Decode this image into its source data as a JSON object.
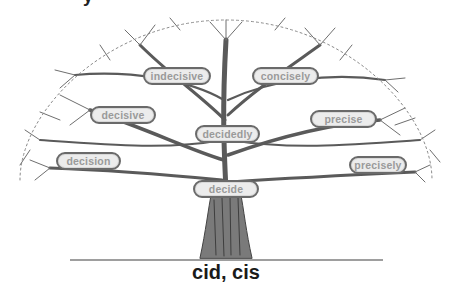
{
  "diagram": {
    "root": "cid, cis",
    "cut_off_top_glyph": "y",
    "words": [
      {
        "id": "indecisive",
        "label": "indecisive",
        "x": 143,
        "y": 67,
        "w": 68
      },
      {
        "id": "concisely",
        "label": "concisely",
        "x": 252,
        "y": 67,
        "w": 67
      },
      {
        "id": "decisive",
        "label": "decisive",
        "x": 90,
        "y": 106,
        "w": 66
      },
      {
        "id": "precise",
        "label": "precise",
        "x": 310,
        "y": 110,
        "w": 67
      },
      {
        "id": "decidedly",
        "label": "decidedly",
        "x": 195,
        "y": 125,
        "w": 65
      },
      {
        "id": "decision",
        "label": "decision",
        "x": 56,
        "y": 152,
        "w": 65
      },
      {
        "id": "precisely",
        "label": "precisely",
        "x": 349,
        "y": 156,
        "w": 58
      },
      {
        "id": "decide",
        "label": "decide",
        "x": 193,
        "y": 180,
        "w": 66
      }
    ],
    "colors": {
      "bubble_fill": "#ececec",
      "bubble_border": "#6a6a6a",
      "bubble_text": "#9a9a9a",
      "branch": "#555555",
      "title": "#1a1a1a"
    }
  }
}
